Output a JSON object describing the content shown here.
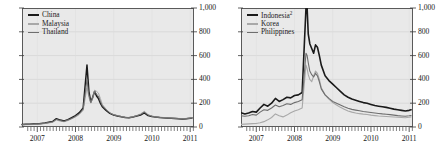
{
  "chart_data": [
    {
      "type": "line",
      "title": "",
      "xlabel": "",
      "ylabel": "",
      "panel": "left",
      "grid": true,
      "legend_position": "top-left",
      "ylim": [
        0,
        1000
      ],
      "yticks": [
        0,
        200,
        400,
        600,
        800,
        1000
      ],
      "ytick_labels": [
        "0",
        "200",
        "400",
        "600",
        "800",
        "1,000"
      ],
      "xlim": [
        "2006.6",
        "2011.1"
      ],
      "xticks": [
        2007,
        2008,
        2009,
        2010,
        2011
      ],
      "xtick_labels": [
        "2007",
        "2008",
        "2009",
        "2010",
        "2011"
      ],
      "x": [
        2006.6,
        2006.7,
        2006.8,
        2006.9,
        2007.0,
        2007.1,
        2007.2,
        2007.3,
        2007.4,
        2007.5,
        2007.6,
        2007.7,
        2007.8,
        2007.9,
        2008.0,
        2008.1,
        2008.2,
        2008.3,
        2008.35,
        2008.4,
        2008.45,
        2008.5,
        2008.55,
        2008.6,
        2008.65,
        2008.7,
        2008.8,
        2008.9,
        2009.0,
        2009.1,
        2009.2,
        2009.3,
        2009.4,
        2009.5,
        2009.6,
        2009.7,
        2009.8,
        2009.9,
        2010.0,
        2010.1,
        2010.2,
        2010.3,
        2010.4,
        2010.5,
        2010.6,
        2010.7,
        2010.8,
        2010.9,
        2011.0,
        2011.05
      ],
      "series": [
        {
          "name": "China",
          "color": "#1a1a1a",
          "width": 1.5,
          "values": [
            22,
            24,
            23,
            25,
            26,
            30,
            34,
            40,
            46,
            70,
            58,
            50,
            62,
            78,
            96,
            120,
            160,
            520,
            300,
            210,
            250,
            300,
            260,
            240,
            200,
            170,
            140,
            115,
            100,
            92,
            86,
            80,
            78,
            84,
            92,
            100,
            118,
            96,
            88,
            84,
            80,
            78,
            76,
            74,
            72,
            70,
            68,
            70,
            74,
            76
          ]
        },
        {
          "name": "Malaysia",
          "color": "#a8a8a8",
          "width": 1.0,
          "values": [
            18,
            19,
            20,
            21,
            22,
            25,
            29,
            34,
            40,
            58,
            50,
            44,
            54,
            68,
            84,
            105,
            140,
            330,
            250,
            200,
            240,
            310,
            300,
            285,
            240,
            190,
            150,
            120,
            104,
            96,
            88,
            82,
            80,
            86,
            96,
            110,
            132,
            104,
            92,
            86,
            82,
            80,
            78,
            76,
            74,
            72,
            70,
            72,
            76,
            78
          ]
        },
        {
          "name": "Thailand",
          "color": "#6e6e6e",
          "width": 1.0,
          "values": [
            20,
            21,
            22,
            23,
            24,
            28,
            32,
            37,
            43,
            64,
            54,
            47,
            58,
            72,
            90,
            112,
            150,
            400,
            270,
            205,
            245,
            300,
            275,
            260,
            215,
            180,
            145,
            118,
            102,
            94,
            87,
            81,
            79,
            85,
            94,
            105,
            125,
            100,
            90,
            85,
            81,
            79,
            77,
            75,
            73,
            71,
            69,
            71,
            75,
            77
          ]
        }
      ]
    },
    {
      "type": "line",
      "title": "",
      "xlabel": "",
      "ylabel": "",
      "panel": "right",
      "grid": true,
      "legend_position": "top-left",
      "ylim": [
        0,
        1000
      ],
      "yticks": [
        0,
        200,
        400,
        600,
        800,
        1000
      ],
      "ytick_labels": [
        "0",
        "200",
        "400",
        "600",
        "800",
        "1,000"
      ],
      "xlim": [
        "2006.6",
        "2011.1"
      ],
      "xticks": [
        2007,
        2008,
        2009,
        2010,
        2011
      ],
      "xtick_labels": [
        "2007",
        "2008",
        "2009",
        "2010",
        "2011"
      ],
      "x": [
        2006.6,
        2006.7,
        2006.8,
        2006.9,
        2007.0,
        2007.1,
        2007.2,
        2007.3,
        2007.4,
        2007.5,
        2007.6,
        2007.7,
        2007.8,
        2007.9,
        2008.0,
        2008.1,
        2008.2,
        2008.3,
        2008.33,
        2008.36,
        2008.4,
        2008.45,
        2008.5,
        2008.55,
        2008.6,
        2008.65,
        2008.7,
        2008.8,
        2008.9,
        2009.0,
        2009.1,
        2009.2,
        2009.3,
        2009.4,
        2009.5,
        2009.6,
        2009.7,
        2009.8,
        2009.9,
        2010.0,
        2010.1,
        2010.2,
        2010.3,
        2010.4,
        2010.5,
        2010.6,
        2010.7,
        2010.8,
        2010.9,
        2011.0,
        2011.05
      ],
      "series": [
        {
          "name": "Indonesia",
          "label_superscript": "2",
          "color": "#1a1a1a",
          "width": 1.6,
          "values": [
            120,
            110,
            118,
            130,
            125,
            160,
            190,
            175,
            200,
            240,
            215,
            230,
            250,
            245,
            265,
            270,
            290,
            1000,
            1000,
            780,
            700,
            660,
            620,
            690,
            670,
            600,
            520,
            430,
            390,
            360,
            330,
            300,
            270,
            250,
            235,
            225,
            215,
            205,
            200,
            190,
            180,
            175,
            170,
            165,
            158,
            150,
            145,
            140,
            135,
            140,
            145
          ]
        },
        {
          "name": "Korea",
          "color": "#a8a8a8",
          "width": 1.1,
          "values": [
            22,
            24,
            26,
            28,
            30,
            35,
            45,
            60,
            80,
            110,
            95,
            85,
            100,
            120,
            135,
            145,
            160,
            520,
            490,
            440,
            400,
            380,
            430,
            470,
            450,
            400,
            330,
            270,
            235,
            205,
            185,
            165,
            150,
            135,
            125,
            118,
            112,
            108,
            105,
            100,
            96,
            92,
            90,
            88,
            86,
            84,
            82,
            80,
            78,
            82,
            85
          ]
        },
        {
          "name": "Philippines",
          "color": "#6e6e6e",
          "width": 1.1,
          "values": [
            95,
            90,
            95,
            105,
            100,
            125,
            145,
            140,
            160,
            185,
            170,
            180,
            195,
            190,
            205,
            215,
            230,
            620,
            600,
            540,
            470,
            440,
            420,
            450,
            430,
            380,
            320,
            270,
            240,
            215,
            200,
            185,
            170,
            158,
            148,
            142,
            136,
            130,
            126,
            122,
            118,
            114,
            110,
            107,
            104,
            100,
            96,
            93,
            90,
            94,
            97
          ]
        }
      ]
    }
  ],
  "panels": {
    "left": {
      "legend": [
        {
          "label": "China"
        },
        {
          "label": "Malaysia"
        },
        {
          "label": "Thailand"
        }
      ],
      "ytick_labels": [
        "1,000",
        "800",
        "600",
        "400",
        "200",
        "0"
      ],
      "xtick_labels": [
        "2007",
        "2008",
        "2009",
        "2010",
        "2011"
      ]
    },
    "right": {
      "legend": [
        {
          "label": "Indonesia",
          "superscript": "2"
        },
        {
          "label": "Korea"
        },
        {
          "label": "Philippines"
        }
      ],
      "ytick_labels": [
        "1,000",
        "800",
        "600",
        "400",
        "200",
        "0"
      ],
      "xtick_labels": [
        "2007",
        "2008",
        "2009",
        "2010",
        "2011"
      ]
    }
  }
}
